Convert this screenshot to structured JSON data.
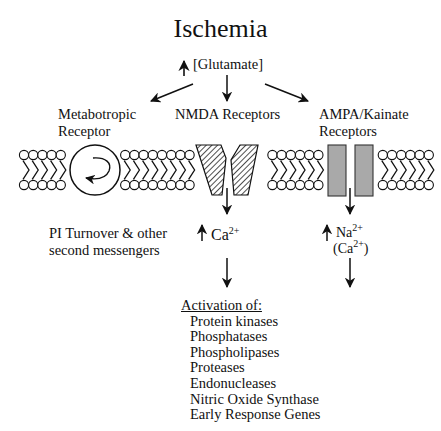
{
  "title": "Ischemia",
  "glutamate": {
    "arrow": "up-arrow",
    "label": "[Glutamate]"
  },
  "receptors": [
    {
      "id": "metabotropic",
      "label_line1": "Metabotropic",
      "label_line2": "Receptor"
    },
    {
      "id": "nmda",
      "label_line1": "NMDA Receptors"
    },
    {
      "id": "ampa",
      "label_line1": "AMPA/Kainate",
      "label_line2": "Receptors"
    }
  ],
  "outcomes": {
    "metabotropic": {
      "line1": "PI Turnover & other",
      "line2": "second messengers"
    },
    "nmda": {
      "ion": "Ca",
      "charge": "2+"
    },
    "ampa": {
      "ion": "Na",
      "charge": "2+",
      "secondary_ion": "(Ca",
      "secondary_charge": "2+",
      "secondary_close": ")"
    }
  },
  "activation": {
    "heading": "Activation of:",
    "items": [
      "Protein kinases",
      "Phosphatases",
      "Phospholipases",
      "Proteases",
      "Endonucleases",
      "Nitric Oxide Synthase",
      "Early Response Genes"
    ]
  },
  "colors": {
    "ink": "#111111",
    "ampa_fill": "#a9a9a9",
    "background": "#ffffff"
  }
}
